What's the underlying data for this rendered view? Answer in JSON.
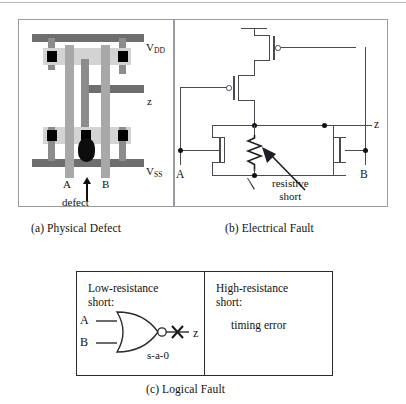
{
  "figure": {
    "panels": [
      {
        "id": "a",
        "caption": "(a) Physical Defect",
        "type": "physical-layout",
        "labels": {
          "vdd": "V",
          "vdd_sub": "DD",
          "vss": "V",
          "vss_sub": "SS",
          "output": "z",
          "input_a": "A",
          "input_b": "B",
          "defect": "defect"
        },
        "layers": {
          "metal": "#6e6e6e",
          "poly": "#a8a8a8",
          "diffusion": "#d3d3d3",
          "contact": "#000000",
          "defect_blob": "#0d0d0d"
        }
      },
      {
        "id": "b",
        "caption": "(b) Electrical Fault",
        "type": "transistor-schematic",
        "labels": {
          "input_a": "A",
          "input_b": "B",
          "output": "z",
          "annotation_line1": "resistive",
          "annotation_line2": "short"
        },
        "components": {
          "pmos_count": 2,
          "nmos_count": 2,
          "resistor": "resistive short",
          "ground": "ground-symbol"
        },
        "wire_color": "#4a4a52"
      },
      {
        "id": "c",
        "caption": "(c) Logical Fault",
        "type": "logic-table",
        "cells": [
          {
            "heading_line1": "Low-resistance",
            "heading_line2": "short:",
            "gate": "NOR",
            "input_a": "A",
            "input_b": "B",
            "output": "z",
            "fault_label": "s-a-0",
            "fault_marker": "X"
          },
          {
            "heading_line1": "High-resistance",
            "heading_line2": "short:",
            "body": "timing error"
          }
        ]
      }
    ]
  }
}
